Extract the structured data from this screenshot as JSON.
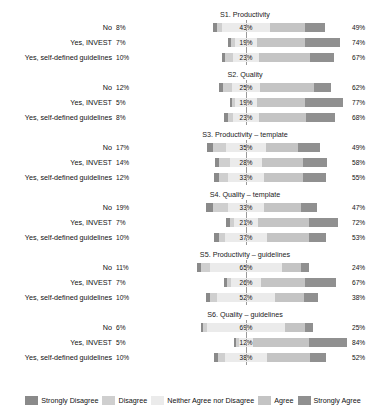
{
  "chart_data": {
    "type": "bar",
    "subtype": "diverging-stacked-likert",
    "title": "",
    "xlabel": "",
    "ylabel": "",
    "grid": false,
    "legend_position": "bottom",
    "legend": [
      {
        "label": "Strongly Disagree",
        "color": "#8a8a8a"
      },
      {
        "label": "Disagree",
        "color": "#cfcfcf"
      },
      {
        "label": "Neither Agree nor Disagree",
        "color": "#ebebeb"
      },
      {
        "label": "Agree",
        "color": "#c4c4c4"
      },
      {
        "label": "Strongly Agree",
        "color": "#909090"
      }
    ],
    "categories": [
      "No",
      "Yes, INVEST",
      "Yes, self-defined guidelines"
    ],
    "series_order": [
      "Strongly Disagree",
      "Disagree",
      "Neither Agree nor Disagree",
      "Agree",
      "Strongly Agree"
    ],
    "panels": [
      {
        "title": "S1. Productivity",
        "rows": [
          {
            "label": "No",
            "left_pct": "8%",
            "center_pct": "43%",
            "right_pct": "49%",
            "left_value": 8,
            "center_value": 43,
            "right_value": 49,
            "segments": [
              4,
              4,
              43,
              31,
              18
            ]
          },
          {
            "label": "Yes, INVEST",
            "left_pct": "7%",
            "center_pct": "19%",
            "right_pct": "74%",
            "left_value": 7,
            "center_value": 19,
            "right_value": 74,
            "segments": [
              3,
              4,
              19,
              43,
              31
            ]
          },
          {
            "label": "Yes, self-defined guidelines",
            "left_pct": "10%",
            "center_pct": "23%",
            "right_pct": "67%",
            "left_value": 10,
            "center_value": 23,
            "right_value": 67,
            "segments": [
              3,
              7,
              23,
              46,
              21
            ]
          }
        ]
      },
      {
        "title": "S2. Quality",
        "rows": [
          {
            "label": "No",
            "left_pct": "12%",
            "center_pct": "25%",
            "right_pct": "62%",
            "left_value": 12,
            "center_value": 25,
            "right_value": 62,
            "segments": [
              4,
              8,
              25,
              48,
              15
            ]
          },
          {
            "label": "Yes, INVEST",
            "left_pct": "5%",
            "center_pct": "19%",
            "right_pct": "77%",
            "left_value": 5,
            "center_value": 19,
            "right_value": 77,
            "segments": [
              2,
              3,
              19,
              43,
              34
            ]
          },
          {
            "label": "Yes, self-defined guidelines",
            "left_pct": "8%",
            "center_pct": "23%",
            "right_pct": "68%",
            "left_value": 8,
            "center_value": 23,
            "right_value": 68,
            "segments": [
              3,
              5,
              23,
              42,
              26
            ]
          }
        ]
      },
      {
        "title": "S3. Productivity – template",
        "rows": [
          {
            "label": "No",
            "left_pct": "17%",
            "center_pct": "35%",
            "right_pct": "49%",
            "left_value": 17,
            "center_value": 35,
            "right_value": 49,
            "segments": [
              5,
              12,
              35,
              29,
              20
            ]
          },
          {
            "label": "Yes, INVEST",
            "left_pct": "14%",
            "center_pct": "28%",
            "right_pct": "58%",
            "left_value": 14,
            "center_value": 28,
            "right_value": 58,
            "segments": [
              4,
              10,
              28,
              37,
              21
            ]
          },
          {
            "label": "Yes, self-defined guidelines",
            "left_pct": "12%",
            "center_pct": "33%",
            "right_pct": "55%",
            "left_value": 12,
            "center_value": 33,
            "right_value": 55,
            "segments": [
              4,
              8,
              33,
              34,
              21
            ]
          }
        ]
      },
      {
        "title": "S4. Quality – template",
        "rows": [
          {
            "label": "No",
            "left_pct": "19%",
            "center_pct": "33%",
            "right_pct": "47%",
            "left_value": 19,
            "center_value": 33,
            "right_value": 47,
            "segments": [
              6,
              13,
              33,
              33,
              14
            ]
          },
          {
            "label": "Yes, INVEST",
            "left_pct": "7%",
            "center_pct": "21%",
            "right_pct": "72%",
            "left_value": 7,
            "center_value": 21,
            "right_value": 72,
            "segments": [
              3,
              4,
              21,
              46,
              26
            ]
          },
          {
            "label": "Yes, self-defined guidelines",
            "left_pct": "10%",
            "center_pct": "37%",
            "right_pct": "53%",
            "left_value": 10,
            "center_value": 37,
            "right_value": 53,
            "segments": [
              4,
              6,
              37,
              38,
              15
            ]
          }
        ]
      },
      {
        "title": "S5. Productivity – guidelines",
        "rows": [
          {
            "label": "No",
            "left_pct": "11%",
            "center_pct": "65%",
            "right_pct": "24%",
            "left_value": 11,
            "center_value": 65,
            "right_value": 24,
            "segments": [
              3,
              8,
              65,
              17,
              7
            ]
          },
          {
            "label": "Yes, INVEST",
            "left_pct": "7%",
            "center_pct": "26%",
            "right_pct": "67%",
            "left_value": 7,
            "center_value": 26,
            "right_value": 67,
            "segments": [
              3,
              4,
              26,
              40,
              27
            ]
          },
          {
            "label": "Yes, self-defined guidelines",
            "left_pct": "10%",
            "center_pct": "52%",
            "right_pct": "38%",
            "left_value": 10,
            "center_value": 52,
            "right_value": 38,
            "segments": [
              4,
              6,
              52,
              26,
              12
            ]
          }
        ]
      },
      {
        "title": "S6. Quality – guidelines",
        "rows": [
          {
            "label": "No",
            "left_pct": "6%",
            "center_pct": "69%",
            "right_pct": "25%",
            "left_value": 6,
            "center_value": 69,
            "right_value": 25,
            "segments": [
              2,
              4,
              69,
              18,
              7
            ]
          },
          {
            "label": "Yes, INVEST",
            "left_pct": "5%",
            "center_pct": "12%",
            "right_pct": "84%",
            "left_value": 5,
            "center_value": 12,
            "right_value": 84,
            "segments": [
              2,
              3,
              12,
              50,
              34
            ]
          },
          {
            "label": "Yes, self-defined guidelines",
            "left_pct": "10%",
            "center_pct": "38%",
            "right_pct": "52%",
            "left_value": 10,
            "center_value": 38,
            "right_value": 52,
            "segments": [
              4,
              6,
              38,
              38,
              14
            ]
          }
        ]
      }
    ]
  }
}
